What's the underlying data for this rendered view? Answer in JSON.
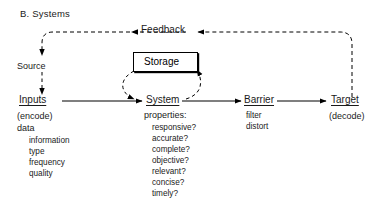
{
  "diagram": {
    "title": "B. Systems",
    "type": "flow-diagram",
    "nodes": {
      "source": {
        "label": "Source"
      },
      "inputs": {
        "label": "Inputs",
        "sub": "(encode)",
        "group": "data",
        "items": [
          "information",
          "type",
          "frequency",
          "quality"
        ]
      },
      "storage": {
        "label": "Storage"
      },
      "system": {
        "label": "System",
        "sub": "properties:",
        "items": [
          "responsive?",
          "accurate?",
          "complete?",
          "objective?",
          "relevant?",
          "concise?",
          "timely?"
        ]
      },
      "barrier": {
        "label": "Barrier",
        "items": [
          "filter",
          "distort"
        ]
      },
      "target": {
        "label": "Target",
        "sub": "(decode)"
      }
    },
    "edges": {
      "feedback_label": "Feedback"
    },
    "colors": {
      "ink": "#1a1a1a",
      "line": "#000000",
      "background": "#ffffff"
    }
  }
}
